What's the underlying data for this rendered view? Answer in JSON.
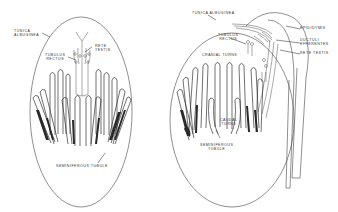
{
  "colors": {
    "background": "#ffffff",
    "line": "#444444",
    "dark_fill": "#2a2a2a",
    "text": "#333333"
  },
  "panels": [
    {
      "id": "left",
      "labels": {
        "tunica_albuginea": [
          "TUNICA",
          "ALBUGINEA"
        ],
        "rete_testis": [
          "RETE",
          "TESTIS"
        ],
        "tubulus_rectus": [
          "TUBULUS",
          "RECTUS"
        ],
        "seminiferous_tubule": "SEMINIFEROUS TUBULE"
      }
    },
    {
      "id": "right",
      "labels": {
        "tunica_albuginea": "TUNICA ALBUGINEA",
        "epididymis": "EPIDIDYMIS",
        "ductuli_efferentes": [
          "DUCTULI",
          "EFFERENTES"
        ],
        "rete_testis": "RETE TESTIS",
        "tubulus_rectus": [
          "TUBULUS",
          "RECTUS"
        ],
        "cranial_turns": "CRANIAL TURNS",
        "caudal_turns": [
          "CAUDAL",
          "TURNS"
        ],
        "seminiferous_tubule": [
          "SEMINIFEROUS",
          "TUBULE"
        ]
      }
    }
  ]
}
